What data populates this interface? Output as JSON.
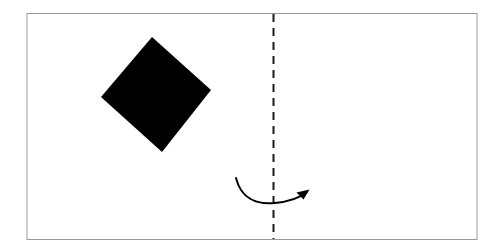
{
  "figure": {
    "title": "Paper folding diagram",
    "description": "A rectangular sheet with a rotated black square on the left half, a vertical dashed fold line near the centre-right, and a curved arrow crossing the fold line from left to right.",
    "background_color": "#ffffff",
    "canvas": {
      "width": 497,
      "height": 251
    }
  },
  "sheet": {
    "name": "sheet-outline",
    "x": 27,
    "y": 13.5,
    "width": 450,
    "height": 226,
    "stroke_color": "#9a9a9a",
    "stroke_width": 1,
    "fill_color": "#ffffff"
  },
  "shapes": {
    "square": {
      "name": "black-square",
      "label": "rotated filled square",
      "fill_color": "#000000",
      "points": [
        {
          "x": 152,
          "y": 37
        },
        {
          "x": 211,
          "y": 90
        },
        {
          "x": 162,
          "y": 152
        },
        {
          "x": 101,
          "y": 97
        }
      ],
      "center": {
        "x": 156.5,
        "y": 94
      },
      "side_length": 79,
      "rotation_degrees": 42
    },
    "fold_line": {
      "name": "fold-line",
      "label": "vertical dashed fold line",
      "x": 273.5,
      "y_start": 14,
      "y_end": 239,
      "stroke_color": "#1a1a1a",
      "stroke_width": 2,
      "dash_length": 8,
      "gap_length": 6
    },
    "fold_arrow": {
      "name": "fold-arrow",
      "label": "curved fold direction arrow",
      "stroke_color": "#000000",
      "stroke_width": 2,
      "direction": "left-to-right",
      "path": "M236,178 C241,198 256,205 275,203 C290,201.5 300,197.5 306.5,192.5",
      "start_point": {
        "x": 236,
        "y": 178
      },
      "low_point": {
        "x": 274,
        "y": 203
      },
      "tip_point": {
        "x": 308,
        "y": 191
      },
      "arrowhead": {
        "name": "arrowhead",
        "points": [
          {
            "x": 309.5,
            "y": 189.5
          },
          {
            "x": 296.5,
            "y": 192.5
          },
          {
            "x": 303.5,
            "y": 199.5
          }
        ],
        "fill_color": "#000000"
      }
    }
  }
}
